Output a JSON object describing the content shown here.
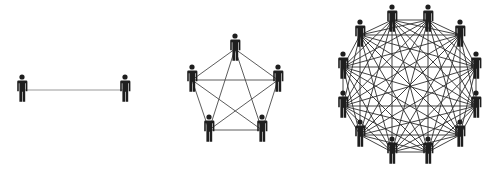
{
  "diagram": {
    "colors": {
      "person": "#1e1e1e",
      "line": "#3a3a3a",
      "line_light": "#9a9a9a",
      "background": "#ffffff"
    },
    "groups": [
      {
        "name": "group-2",
        "people_count": 2,
        "connections": 1,
        "people": [
          {
            "x": 22,
            "y": 90
          },
          {
            "x": 125,
            "y": 90
          }
        ],
        "line_color": "#9a9a9a"
      },
      {
        "name": "group-5",
        "people_count": 5,
        "connections": 10,
        "people": [
          {
            "x": 235,
            "y": 49
          },
          {
            "x": 278,
            "y": 80
          },
          {
            "x": 262,
            "y": 130
          },
          {
            "x": 209,
            "y": 130
          },
          {
            "x": 192,
            "y": 80
          }
        ],
        "line_color": "#4a4a4a"
      },
      {
        "name": "group-12",
        "people_count": 12,
        "connections": 66,
        "people": [
          {
            "x": 392,
            "y": 20
          },
          {
            "x": 428,
            "y": 20
          },
          {
            "x": 460,
            "y": 35
          },
          {
            "x": 476,
            "y": 67
          },
          {
            "x": 476,
            "y": 106
          },
          {
            "x": 460,
            "y": 135
          },
          {
            "x": 428,
            "y": 152
          },
          {
            "x": 392,
            "y": 152
          },
          {
            "x": 360,
            "y": 135
          },
          {
            "x": 343,
            "y": 106
          },
          {
            "x": 343,
            "y": 67
          },
          {
            "x": 360,
            "y": 35
          }
        ],
        "line_color": "#2e2e2e"
      }
    ]
  }
}
